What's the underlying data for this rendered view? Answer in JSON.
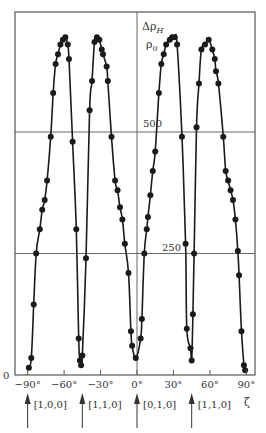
{
  "chart_data": {
    "type": "line",
    "title": "",
    "xlabel": "ζ",
    "ylabel": "Δρ_H / ρ0",
    "xlim": [
      -90,
      90
    ],
    "ylim": [
      0,
      740
    ],
    "x_ticks": [
      "−90°",
      "−60°",
      "−30°",
      "0°",
      "30°",
      "60°",
      "90°"
    ],
    "x_tick_values": [
      -90,
      -60,
      -30,
      0,
      30,
      60,
      90
    ],
    "y_ticks": [
      "0",
      "250",
      "500"
    ],
    "y_tick_values": [
      0,
      250,
      500
    ],
    "grid": true,
    "markers": "filled-circle",
    "annotations": [
      {
        "label": "[1,0,0]",
        "x": -90
      },
      {
        "label": "[1,1,0]",
        "x": -45
      },
      {
        "label": "[0,1,0]",
        "x": 0
      },
      {
        "label": "[1,1,0]",
        "x": 45
      }
    ],
    "series": [
      {
        "name": "Δρ_H/ρ0",
        "x": [
          -89,
          -87,
          -85,
          -83,
          -80,
          -78,
          -76,
          -74,
          -71,
          -69,
          -67,
          -65,
          -63,
          -61,
          -59,
          -57,
          -56,
          -53,
          -50,
          -48,
          -47,
          -46,
          -45,
          -42,
          -39,
          -37,
          -35,
          -33,
          -31,
          -29,
          -28,
          -25,
          -24,
          -21,
          -18,
          -16,
          -14,
          -12,
          -10,
          -7,
          -5,
          -4,
          -1,
          3,
          4,
          6,
          8,
          9,
          11,
          13,
          15,
          18,
          20,
          22,
          24,
          27,
          29,
          31,
          33,
          37,
          40,
          41,
          44,
          45,
          46,
          47,
          49,
          51,
          53,
          56,
          59,
          62,
          64,
          65,
          67,
          71,
          73,
          75,
          77,
          79,
          81,
          83,
          84,
          86,
          88,
          89
        ],
        "values": [
          15,
          35,
          145,
          250,
          300,
          340,
          360,
          400,
          490,
          580,
          640,
          660,
          680,
          690,
          695,
          680,
          650,
          480,
          300,
          75,
          30,
          20,
          40,
          240,
          545,
          605,
          685,
          695,
          690,
          670,
          660,
          635,
          605,
          490,
          400,
          380,
          345,
          320,
          270,
          210,
          90,
          60,
          35,
          75,
          115,
          250,
          300,
          325,
          370,
          420,
          460,
          580,
          640,
          660,
          680,
          690,
          695,
          695,
          680,
          490,
          270,
          95,
          55,
          30,
          125,
          250,
          510,
          600,
          670,
          680,
          690,
          670,
          650,
          625,
          600,
          490,
          420,
          400,
          380,
          360,
          320,
          255,
          205,
          90,
          20,
          10
        ]
      }
    ]
  },
  "axis": {
    "y_label_top": "Δρ",
    "y_label_top_sub": "H",
    "y_label_bottom": "ρ",
    "y_label_bottom_sub": "0",
    "zero_label": "0",
    "label_250": "250",
    "label_500": "500",
    "zeta_label": "ζ"
  },
  "colors": {
    "line": "#1a1a1a",
    "marker": "#1a1a1a",
    "grid": "#555555",
    "frame": "#555555"
  }
}
